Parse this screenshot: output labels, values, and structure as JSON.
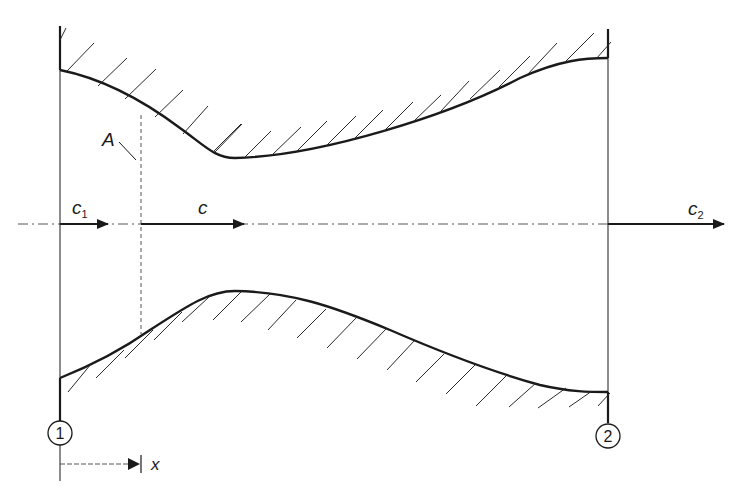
{
  "diagram": {
    "colors": {
      "line": "#1a1a1a",
      "hatch": "#2a2a2a",
      "background": "#ffffff"
    },
    "labels": {
      "area": "A",
      "velocity_inlet": "c",
      "velocity_inlet_sub": "1",
      "velocity_local": "c",
      "velocity_outlet": "c",
      "velocity_outlet_sub": "2",
      "coordinate": "x",
      "section_inlet": "1",
      "section_outlet": "2"
    },
    "elements": {
      "upper_wall": "converging-diverging contour with hatching above",
      "lower_wall": "converging-diverging contour with hatching below",
      "centerline": "dash-dot axis",
      "section_lines": [
        "section 1 (inlet)",
        "section 2 (outlet)"
      ],
      "arrows": [
        "c1 inlet velocity",
        "c local velocity",
        "c2 outlet velocity",
        "x coordinate"
      ]
    }
  }
}
